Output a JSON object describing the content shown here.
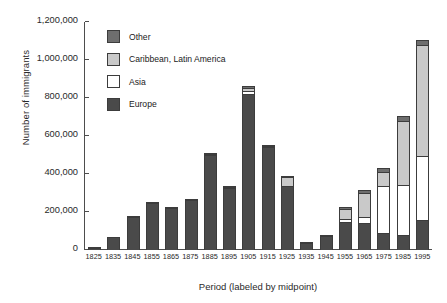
{
  "chart_data": {
    "type": "bar",
    "stacked": true,
    "title": "",
    "xlabel": "Period (labeled by midpoint)",
    "ylabel": "Number of immigrants",
    "ylim": [
      0,
      1200000
    ],
    "yticks": [
      0,
      200000,
      400000,
      600000,
      800000,
      1000000,
      1200000
    ],
    "ytick_labels": [
      "0",
      "200,000",
      "400,000",
      "600,000",
      "800,000",
      "1,000,000",
      "1,200,000"
    ],
    "grid": false,
    "legend_position": "inside upper-left",
    "categories": [
      "1825",
      "1835",
      "1845",
      "1855",
      "1865",
      "1875",
      "1885",
      "1895",
      "1905",
      "1915",
      "1925",
      "1935",
      "1945",
      "1955",
      "1965",
      "1975",
      "1985",
      "1995"
    ],
    "series": [
      {
        "name": "Europe",
        "color": "#4a4a4a",
        "values": [
          12000,
          68000,
          175000,
          250000,
          222000,
          265000,
          500000,
          325000,
          820000,
          540000,
          335000,
          38000,
          75000,
          150000,
          140000,
          90000,
          80000,
          160000
        ]
      },
      {
        "name": "Asia",
        "color": "#ffffff",
        "values": [
          1000,
          2000,
          3000,
          4000,
          4000,
          6000,
          8000,
          8000,
          20000,
          8000,
          5000,
          3000,
          6000,
          18000,
          40000,
          250000,
          270000,
          340000
        ]
      },
      {
        "name": "Caribbean, Latin America",
        "color": "#c9c9c9",
        "values": [
          1000,
          2000,
          3000,
          4000,
          4000,
          5000,
          8000,
          10000,
          25000,
          12000,
          55000,
          5000,
          8000,
          60000,
          130000,
          80000,
          340000,
          590000
        ]
      },
      {
        "name": "Other",
        "color": "#6e6e6e",
        "values": [
          2000,
          4000,
          6000,
          7000,
          7000,
          8000,
          9000,
          10000,
          15000,
          10000,
          8000,
          4000,
          7000,
          15000,
          20000,
          25000,
          30000,
          30000
        ]
      }
    ],
    "totals": [
      16000,
      76000,
      187000,
      265000,
      237000,
      284000,
      525000,
      353000,
      880000,
      570000,
      403000,
      50000,
      96000,
      243000,
      330000,
      445000,
      720000,
      1120000
    ]
  }
}
